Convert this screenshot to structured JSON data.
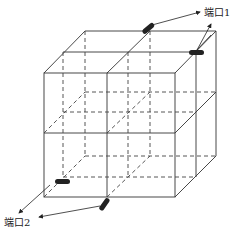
{
  "diagram": {
    "type": "3d-cube-with-cross-partitions",
    "labels": {
      "port1": "端口1",
      "port2": "端口2"
    },
    "colors": {
      "line": "#333333",
      "port": "#222222"
    }
  }
}
